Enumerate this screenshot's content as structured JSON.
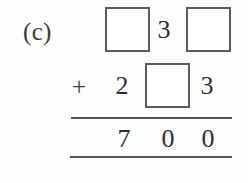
{
  "problem": {
    "part_label": "(c)",
    "type": "column-addition-with-blanks",
    "rows": [
      {
        "name": "addend-1",
        "cells": [
          {
            "kind": "blank-box",
            "value": ""
          },
          {
            "kind": "digit",
            "value": "3"
          },
          {
            "kind": "blank-box",
            "value": ""
          }
        ]
      },
      {
        "name": "addend-2",
        "operator": "+",
        "cells": [
          {
            "kind": "digit",
            "value": "2"
          },
          {
            "kind": "blank-box",
            "value": ""
          },
          {
            "kind": "digit",
            "value": "3"
          }
        ]
      },
      {
        "name": "sum",
        "cells": [
          {
            "kind": "digit",
            "value": "7"
          },
          {
            "kind": "digit",
            "value": "0"
          },
          {
            "kind": "digit",
            "value": "0"
          }
        ]
      }
    ]
  },
  "style": {
    "ink": "#2e2e2e",
    "box_border": "#5d5d5d",
    "rule": "#545454",
    "paper": "#fdfdfc"
  }
}
